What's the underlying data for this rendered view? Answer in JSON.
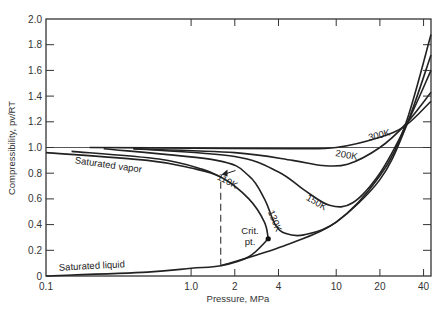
{
  "chart_data": {
    "type": "line",
    "title": "",
    "xlabel": "Pressure, MPa",
    "ylabel": "Compressibility, pv/RT",
    "xscale": "log",
    "xlim": [
      0.1,
      45
    ],
    "ylim": [
      0,
      2.0
    ],
    "x_ticks": [
      "0.1",
      "1.0",
      "2",
      "4",
      "10",
      "20",
      "40"
    ],
    "y_ticks": [
      "0",
      "0.2",
      "0.4",
      "0.6",
      "0.8",
      "1.0",
      "1.2",
      "1.4",
      "1.6",
      "1.8",
      "2.0"
    ],
    "grid": false,
    "reference_line": {
      "y": 1.0,
      "label": ""
    },
    "series": [
      {
        "name": "300K",
        "points": [
          [
            0.2,
            1.0
          ],
          [
            1,
            0.995
          ],
          [
            5,
            0.99
          ],
          [
            10,
            1.0
          ],
          [
            20,
            1.08
          ],
          [
            30,
            1.17
          ],
          [
            45,
            1.36
          ]
        ]
      },
      {
        "name": "200K",
        "points": [
          [
            0.4,
            0.99
          ],
          [
            2,
            0.96
          ],
          [
            5,
            0.9
          ],
          [
            8,
            0.86
          ],
          [
            12,
            0.87
          ],
          [
            20,
            1.0
          ],
          [
            30,
            1.18
          ],
          [
            45,
            1.43
          ]
        ]
      },
      {
        "name": "150K",
        "points": [
          [
            0.4,
            0.99
          ],
          [
            2,
            0.93
          ],
          [
            4,
            0.81
          ],
          [
            6,
            0.67
          ],
          [
            9,
            0.55
          ],
          [
            13,
            0.57
          ],
          [
            20,
            0.8
          ],
          [
            30,
            1.16
          ],
          [
            45,
            1.6
          ]
        ]
      },
      {
        "name": "130K",
        "points": [
          [
            0.25,
            0.99
          ],
          [
            1.5,
            0.9
          ],
          [
            2.5,
            0.78
          ],
          [
            3.2,
            0.6
          ],
          [
            3.8,
            0.4
          ],
          [
            4.5,
            0.33
          ],
          [
            6,
            0.32
          ],
          [
            10,
            0.42
          ],
          [
            20,
            0.75
          ],
          [
            30,
            1.15
          ],
          [
            45,
            1.72
          ]
        ]
      },
      {
        "name": "110K",
        "points": [
          [
            0.15,
            0.97
          ],
          [
            0.6,
            0.91
          ],
          [
            1.2,
            0.83
          ],
          [
            1.6,
            0.77
          ]
        ]
      },
      {
        "name": "Saturated vapor",
        "points": [
          [
            0.1,
            0.96
          ],
          [
            0.5,
            0.9
          ],
          [
            1.0,
            0.84
          ],
          [
            1.6,
            0.77
          ],
          [
            2.5,
            0.6
          ],
          [
            3.2,
            0.42
          ],
          [
            3.4,
            0.29
          ]
        ]
      },
      {
        "name": "Saturated liquid",
        "points": [
          [
            0.1,
            0.0
          ],
          [
            0.5,
            0.03
          ],
          [
            1.0,
            0.06
          ],
          [
            1.6,
            0.08
          ],
          [
            2.5,
            0.15
          ],
          [
            3.4,
            0.29
          ]
        ]
      },
      {
        "name": "Liquid compressed",
        "points": [
          [
            1.6,
            0.08
          ],
          [
            4,
            0.22
          ],
          [
            10,
            0.42
          ],
          [
            20,
            0.78
          ],
          [
            30,
            1.18
          ],
          [
            45,
            1.88
          ]
        ]
      }
    ],
    "annotations": [
      {
        "text": "300K",
        "x": 30,
        "y": 1.14
      },
      {
        "text": "200K",
        "x": 16,
        "y": 0.93
      },
      {
        "text": "150K",
        "x": 12,
        "y": 0.6
      },
      {
        "text": "130K",
        "x": 4.5,
        "y": 0.55
      },
      {
        "text": "110K",
        "x": 2.3,
        "y": 0.82
      },
      {
        "text": "Saturated vapor",
        "x": 0.55,
        "y": 0.83
      },
      {
        "text": "Saturated liquid",
        "x": 0.3,
        "y": 0.06
      },
      {
        "text": "Crit. pt.",
        "x": 3.4,
        "y": 0.29
      }
    ],
    "dashed_line": {
      "x": 1.6,
      "y_from": 0.08,
      "y_to": 0.77
    }
  }
}
